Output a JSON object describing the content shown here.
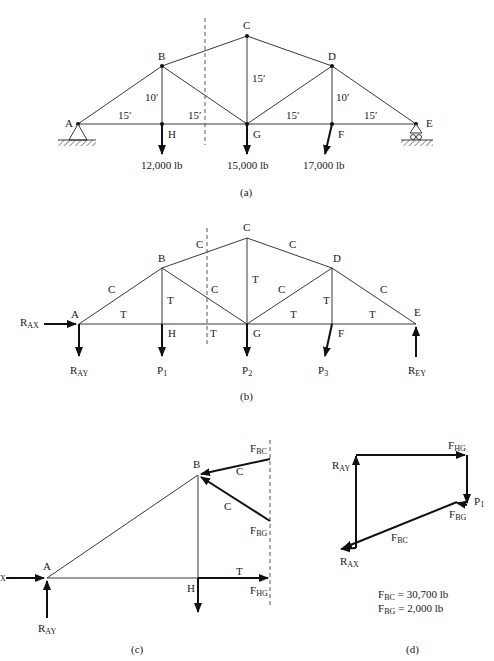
{
  "figure_a": {
    "caption": "(a)",
    "nodes": {
      "A": "A",
      "B": "B",
      "C": "C",
      "D": "D",
      "E": "E",
      "F": "F",
      "G": "G",
      "H": "H"
    },
    "dimensions": {
      "ah": "15′",
      "hg": "15′",
      "gf": "15′",
      "fe": "15′",
      "bh": "10′",
      "cg": "15′",
      "df": "10′"
    },
    "loads": {
      "h": "12,000 lb",
      "g": "15,000 lb",
      "f": "17,000 lb"
    }
  },
  "figure_b": {
    "caption": "(b)",
    "nodes": {
      "A": "A",
      "B": "B",
      "C": "C",
      "D": "D",
      "E": "E",
      "F": "F",
      "G": "G",
      "H": "H"
    },
    "members": {
      "ab": "C",
      "bc": "C",
      "cd": "C",
      "de": "C",
      "bg": "C",
      "gd": "C",
      "bh": "T",
      "cg": "T",
      "df": "T",
      "ah": "T",
      "hg": "T",
      "gf": "T",
      "fe": "T"
    },
    "forces": {
      "rax": "R",
      "rax_sub": "AX",
      "ray": "R",
      "ray_sub": "AY",
      "p1": "P",
      "p1_sub": "1",
      "p2": "P",
      "p2_sub": "2",
      "p3": "P",
      "p3_sub": "3",
      "rey": "R",
      "rey_sub": "EY"
    }
  },
  "figure_c": {
    "caption": "(c)",
    "nodes": {
      "A": "A",
      "B": "B",
      "H": "H"
    },
    "members": {
      "bc": "C",
      "bg": "C",
      "hg": "T"
    },
    "forces": {
      "fbc": "F",
      "fbc_sub": "BC",
      "fbg": "F",
      "fbg_sub": "BG",
      "fhg": "F",
      "fhg_sub": "HG",
      "ray": "R",
      "ray_sub": "AY",
      "rax_sub": "X"
    }
  },
  "figure_d": {
    "caption": "(d)",
    "forces": {
      "fhg": "F",
      "fhg_sub": "HG",
      "ray": "R",
      "ray_sub": "AY",
      "p1": "P",
      "p1_sub": "1",
      "fbg": "F",
      "fbg_sub": "BG",
      "fbc": "F",
      "fbc_sub": "BC",
      "rax": "R",
      "rax_sub": "AX"
    },
    "results": {
      "fbc_label": "F",
      "fbc_sub": "BC",
      "fbc_value": "= 30,700 lb",
      "fbg_label": "F",
      "fbg_sub": "BG",
      "fbg_value": "= 2,000 lb"
    }
  }
}
